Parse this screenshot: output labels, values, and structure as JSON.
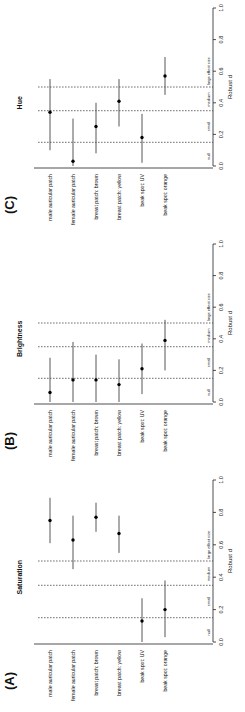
{
  "figure": {
    "rotation": "rotated 90 degrees counter-clockwise",
    "thresholds": [
      {
        "label": "null",
        "value": 0.0
      },
      {
        "label": "small",
        "value": 0.15
      },
      {
        "label": "medium",
        "value": 0.35
      },
      {
        "label": "large effect size",
        "value": 0.5
      }
    ]
  },
  "chart_data": [
    {
      "type": "scatter",
      "panel": "(A)",
      "title": "Saturation",
      "xlabel": "Robust d",
      "ylabel": "",
      "xlim": [
        0,
        1.0
      ],
      "xticks": [
        "0.0",
        "0.2",
        "0.4",
        "0.6",
        "0.8",
        "1.0"
      ],
      "reference_lines": [
        0.15,
        0.35,
        0.5
      ],
      "region_labels": [
        "null",
        "small",
        "medium",
        "large effect size"
      ],
      "categories": [
        "male auricular patch",
        "female auricular patch",
        "breast patch: brown",
        "breast patch: yellow",
        "beak spot: UV",
        "beak spot: orange"
      ],
      "values": [
        0.75,
        0.63,
        0.77,
        0.67,
        0.13,
        0.2
      ],
      "ci_low": [
        0.61,
        0.45,
        0.68,
        0.55,
        0.0,
        0.03
      ],
      "ci_high": [
        0.89,
        0.78,
        0.86,
        0.78,
        0.27,
        0.38
      ]
    },
    {
      "type": "scatter",
      "panel": "(B)",
      "title": "Brightness",
      "xlabel": "Robust d",
      "ylabel": "",
      "xlim": [
        0,
        1.0
      ],
      "xticks": [
        "0.0",
        "0.2",
        "0.4",
        "0.6",
        "0.8",
        "1.0"
      ],
      "reference_lines": [
        0.15,
        0.35,
        0.5
      ],
      "region_labels": [
        "null",
        "small",
        "medium",
        "large effect size"
      ],
      "categories": [
        "male auricular patch",
        "female auricular patch",
        "breast patch: brown",
        "breast patch: yellow",
        "beak spot: UV",
        "beak spot: orange"
      ],
      "values": [
        0.06,
        0.14,
        0.14,
        0.11,
        0.21,
        0.39
      ],
      "ci_low": [
        0.0,
        0.0,
        0.0,
        0.0,
        0.05,
        0.2
      ],
      "ci_high": [
        0.28,
        0.38,
        0.3,
        0.27,
        0.37,
        0.52
      ]
    },
    {
      "type": "scatter",
      "panel": "(C)",
      "title": "Hue",
      "xlabel": "Robust d",
      "ylabel": "",
      "xlim": [
        0,
        1.0
      ],
      "xticks": [
        "0.0",
        "0.2",
        "0.4",
        "0.6",
        "0.8",
        "1.0"
      ],
      "reference_lines": [
        0.15,
        0.35,
        0.5
      ],
      "region_labels": [
        "null",
        "small",
        "medium",
        "large effect size"
      ],
      "categories": [
        "male auricular patch",
        "female auricular patch",
        "breast patch: brown",
        "breast patch: yellow",
        "beak spot: UV",
        "beak spot: orange"
      ],
      "values": [
        0.34,
        0.03,
        0.25,
        0.41,
        0.18,
        0.57
      ],
      "ci_low": [
        0.1,
        0.0,
        0.08,
        0.25,
        0.02,
        0.45
      ],
      "ci_high": [
        0.55,
        0.3,
        0.4,
        0.55,
        0.33,
        0.69
      ]
    }
  ]
}
